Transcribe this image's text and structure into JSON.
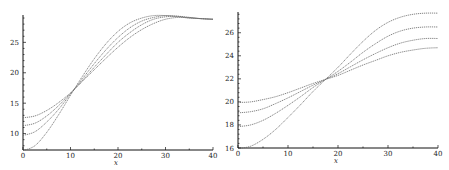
{
  "chart_data": [
    {
      "type": "line",
      "title": "",
      "xlabel": "x",
      "ylabel": "",
      "xlim": [
        0,
        40
      ],
      "ylim": [
        7.3,
        29.5
      ],
      "xticks": [
        0,
        10,
        20,
        30,
        40
      ],
      "xtick_labels": [
        "0",
        "10",
        "20",
        "30",
        "40"
      ],
      "yticks": [
        10,
        15,
        20,
        25
      ],
      "ytick_labels": [
        "10",
        "15",
        "20",
        "25"
      ],
      "grid": false,
      "legend": null,
      "x": [
        0,
        2.5,
        5,
        7.5,
        10,
        12.5,
        15,
        17.5,
        20,
        22.5,
        25,
        27.5,
        30,
        32.5,
        35,
        37.5,
        40
      ],
      "series": [
        {
          "name": "curve-1",
          "values": [
            12.6,
            12.9,
            13.8,
            15.1,
            16.7,
            18.6,
            20.5,
            22.4,
            24.2,
            25.8,
            27.1,
            28.1,
            28.8,
            29.1,
            29.1,
            28.9,
            28.8
          ]
        },
        {
          "name": "curve-2",
          "values": [
            11.3,
            11.7,
            12.9,
            14.6,
            16.6,
            18.7,
            20.9,
            23.0,
            25.0,
            26.6,
            27.9,
            28.8,
            29.2,
            29.3,
            29.1,
            28.9,
            28.8
          ]
        },
        {
          "name": "curve-3",
          "values": [
            9.7,
            10.3,
            11.9,
            14.0,
            16.5,
            19.0,
            21.5,
            23.8,
            25.8,
            27.4,
            28.5,
            29.1,
            29.4,
            29.3,
            29.0,
            28.9,
            28.8
          ]
        },
        {
          "name": "curve-4",
          "values": [
            7.2,
            8.0,
            10.2,
            13.1,
            16.3,
            19.4,
            22.3,
            24.8,
            26.8,
            28.2,
            29.0,
            29.4,
            29.4,
            29.2,
            29.0,
            28.9,
            28.8
          ]
        }
      ]
    },
    {
      "type": "line",
      "title": "",
      "xlabel": "x",
      "ylabel": "",
      "xlim": [
        0,
        40
      ],
      "ylim": [
        16,
        27.8
      ],
      "xticks": [
        0,
        10,
        20,
        30,
        40
      ],
      "xtick_labels": [
        "0",
        "10",
        "20",
        "30",
        "40"
      ],
      "yticks": [
        16,
        18,
        20,
        22,
        24,
        26
      ],
      "ytick_labels": [
        "16",
        "18",
        "20",
        "22",
        "24",
        "26"
      ],
      "grid": false,
      "legend": null,
      "x": [
        0,
        2.5,
        5,
        7.5,
        10,
        12.5,
        15,
        17.5,
        20,
        22.5,
        25,
        27.5,
        30,
        32.5,
        35,
        37.5,
        40
      ],
      "series": [
        {
          "name": "curve-1",
          "values": [
            19.95,
            20.0,
            20.2,
            20.45,
            20.8,
            21.2,
            21.6,
            21.95,
            22.3,
            22.75,
            23.2,
            23.6,
            24.0,
            24.3,
            24.5,
            24.65,
            24.7
          ]
        },
        {
          "name": "curve-2",
          "values": [
            19.05,
            19.15,
            19.4,
            19.85,
            20.35,
            20.9,
            21.45,
            21.95,
            22.45,
            23.05,
            23.65,
            24.2,
            24.7,
            25.1,
            25.35,
            25.5,
            25.5
          ]
        },
        {
          "name": "curve-3",
          "values": [
            17.85,
            18.0,
            18.4,
            19.0,
            19.7,
            20.45,
            21.25,
            21.95,
            22.65,
            23.45,
            24.3,
            25.05,
            25.7,
            26.15,
            26.4,
            26.5,
            26.5
          ]
        },
        {
          "name": "curve-4",
          "values": [
            15.95,
            16.15,
            16.75,
            17.6,
            18.65,
            19.75,
            20.9,
            21.95,
            23.0,
            24.15,
            25.25,
            26.2,
            26.9,
            27.35,
            27.6,
            27.7,
            27.7
          ]
        }
      ]
    }
  ]
}
